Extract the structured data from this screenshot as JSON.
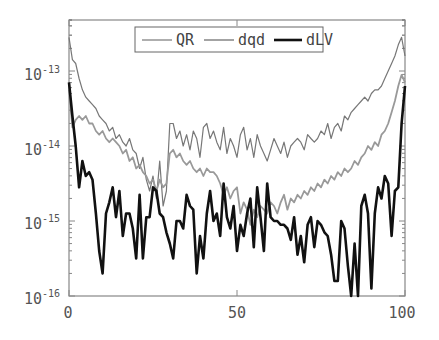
{
  "chart_data": {
    "type": "line",
    "title": "",
    "xlabel": "",
    "ylabel": "",
    "xscale": "linear",
    "yscale": "log",
    "xlim": [
      0,
      100
    ],
    "ylim": [
      1e-16,
      5e-13
    ],
    "xticks": [
      0,
      50,
      100
    ],
    "xtick_labels": [
      "0",
      "50",
      "100"
    ],
    "yticks": [
      1e-16,
      1e-15,
      1e-14,
      1e-13
    ],
    "ytick_labels": [
      {
        "base": "10",
        "exp": "-16"
      },
      {
        "base": "10",
        "exp": "-15"
      },
      {
        "base": "10",
        "exp": "-14"
      },
      {
        "base": "10",
        "exp": "-13"
      }
    ],
    "grid": false,
    "legend_position": "upper center",
    "legend": [
      "QR",
      "dqd",
      "dLV"
    ],
    "series": [
      {
        "name": "QR",
        "color": "#777777",
        "width": 1.2,
        "log10_values": [
          -12.55,
          -12.85,
          -12.9,
          -13.1,
          -13.25,
          -13.35,
          -13.4,
          -13.45,
          -13.5,
          -13.6,
          -13.65,
          -13.7,
          -13.8,
          -13.75,
          -13.9,
          -13.85,
          -13.95,
          -14.0,
          -13.9,
          -14.05,
          -14.1,
          -14.3,
          -14.15,
          -14.45,
          -14.6,
          -14.4,
          -14.7,
          -14.2,
          -14.8,
          -14.6,
          -13.7,
          -13.7,
          -13.9,
          -13.8,
          -14.0,
          -13.85,
          -14.05,
          -13.8,
          -13.9,
          -14.15,
          -13.75,
          -13.7,
          -13.9,
          -13.8,
          -13.95,
          -14.05,
          -13.75,
          -14.1,
          -13.9,
          -14.0,
          -14.15,
          -13.85,
          -13.75,
          -14.05,
          -13.9,
          -14.15,
          -13.85,
          -14.0,
          -14.1,
          -14.2,
          -14.05,
          -13.9,
          -14.0,
          -14.1,
          -13.95,
          -14.15,
          -14.0,
          -13.95,
          -13.9,
          -13.95,
          -14.05,
          -13.85,
          -13.9,
          -13.95,
          -13.9,
          -13.8,
          -13.85,
          -13.7,
          -13.9,
          -13.75,
          -13.7,
          -13.8,
          -13.6,
          -13.65,
          -13.55,
          -13.5,
          -13.45,
          -13.4,
          -13.35,
          -13.4,
          -13.3,
          -13.25,
          -13.25,
          -13.2,
          -13.1,
          -13.0,
          -12.9,
          -12.8,
          -12.65,
          -12.55,
          -12.8
        ]
      },
      {
        "name": "dqd",
        "color": "#999999",
        "width": 1.8,
        "log10_values": [
          -13.25,
          -13.75,
          -13.65,
          -13.6,
          -13.65,
          -13.6,
          -13.7,
          -13.7,
          -13.8,
          -13.85,
          -13.8,
          -13.9,
          -13.95,
          -13.9,
          -13.95,
          -14.0,
          -14.1,
          -14.05,
          -14.2,
          -14.15,
          -14.3,
          -14.25,
          -14.35,
          -14.4,
          -14.5,
          -14.45,
          -14.6,
          -14.45,
          -14.55,
          -14.5,
          -14.1,
          -14.05,
          -14.15,
          -14.1,
          -14.2,
          -14.25,
          -14.2,
          -14.3,
          -14.35,
          -14.3,
          -14.4,
          -14.3,
          -14.35,
          -14.35,
          -14.4,
          -14.5,
          -14.65,
          -14.55,
          -14.7,
          -14.6,
          -14.55,
          -14.9,
          -14.75,
          -14.85,
          -15.05,
          -14.85,
          -14.95,
          -14.8,
          -14.85,
          -14.9,
          -14.75,
          -14.8,
          -14.9,
          -14.75,
          -14.65,
          -14.85,
          -14.7,
          -14.75,
          -14.65,
          -14.7,
          -14.6,
          -14.65,
          -14.55,
          -14.6,
          -14.5,
          -14.55,
          -14.45,
          -14.5,
          -14.4,
          -14.45,
          -14.35,
          -14.4,
          -14.3,
          -14.35,
          -14.3,
          -14.2,
          -14.25,
          -14.15,
          -14.1,
          -14.0,
          -14.05,
          -13.95,
          -14.0,
          -13.85,
          -13.8,
          -13.7,
          -13.55,
          -13.4,
          -13.2,
          -13.05,
          -13.15
        ]
      },
      {
        "name": "dLV",
        "color": "#111111",
        "width": 2.6,
        "log10_values": [
          -13.15,
          -13.6,
          -14.0,
          -14.55,
          -14.2,
          -14.4,
          -14.35,
          -14.45,
          -14.9,
          -15.4,
          -15.7,
          -14.9,
          -14.75,
          -14.55,
          -14.95,
          -14.6,
          -15.2,
          -14.9,
          -14.9,
          -15.1,
          -15.5,
          -14.65,
          -15.5,
          -14.95,
          -14.95,
          -14.55,
          -14.6,
          -14.9,
          -14.95,
          -15.15,
          -15.3,
          -15.5,
          -15.0,
          -15.0,
          -15.1,
          -14.65,
          -14.8,
          -14.85,
          -15.7,
          -15.2,
          -15.5,
          -14.9,
          -14.6,
          -15.0,
          -14.9,
          -15.2,
          -14.5,
          -14.95,
          -15.1,
          -14.8,
          -15.4,
          -15.05,
          -15.2,
          -14.9,
          -14.7,
          -15.35,
          -14.55,
          -14.95,
          -15.4,
          -14.5,
          -14.95,
          -15.0,
          -15.0,
          -15.05,
          -15.05,
          -15.1,
          -15.25,
          -14.95,
          -15.45,
          -15.2,
          -15.55,
          -15.05,
          -14.95,
          -15.35,
          -15.0,
          -15.05,
          -15.15,
          -15.2,
          -15.45,
          -15.8,
          -15.8,
          -15.0,
          -15.1,
          -15.6,
          -16.0,
          -15.3,
          -16.05,
          -14.8,
          -14.65,
          -14.9,
          -15.9,
          -14.9,
          -14.55,
          -14.7,
          -14.4,
          -14.5,
          -15.2,
          -14.6,
          -14.55,
          -13.7,
          -13.2
        ]
      }
    ]
  },
  "legend": {
    "items": [
      {
        "label": "QR"
      },
      {
        "label": "dqd"
      },
      {
        "label": "dLV"
      }
    ]
  },
  "axes": {
    "x_labels": [
      "0",
      "50",
      "100"
    ],
    "y_labels": [
      {
        "base": "10",
        "exp": "-13"
      },
      {
        "base": "10",
        "exp": "-14"
      },
      {
        "base": "10",
        "exp": "-15"
      },
      {
        "base": "10",
        "exp": "-16"
      }
    ]
  }
}
